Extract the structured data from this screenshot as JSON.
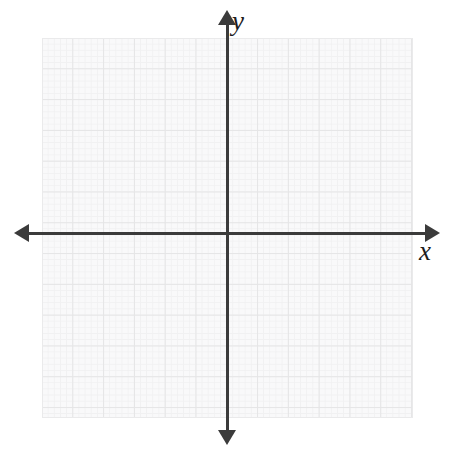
{
  "figure": {
    "type": "coordinate-plane",
    "title": "",
    "background_color": "#ffffff",
    "grid_fill_color": "#fbfbfb",
    "grid_major_color": "#dcdcdc",
    "grid_minor_color": "#eeeeee",
    "axis_color": "#3b3b3b"
  },
  "axes": {
    "x": {
      "label": "x",
      "arrow_start": "left-arrow-icon",
      "arrow_end": "right-arrow-icon"
    },
    "y": {
      "label": "y",
      "arrow_start": "down-arrow-icon",
      "arrow_end": "up-arrow-icon"
    }
  },
  "chart_data": {
    "type": "scatter",
    "title": "",
    "xlabel": "x",
    "ylabel": "y",
    "series": [
      {
        "name": "",
        "x": [],
        "y": []
      }
    ],
    "xlim": [
      -6,
      6
    ],
    "ylim": [
      -6,
      6
    ],
    "grid": true,
    "grid_major_cells_x": 12,
    "grid_major_cells_y": 12,
    "grid_minor_per_major": 5,
    "legend": "none",
    "annotations": []
  }
}
